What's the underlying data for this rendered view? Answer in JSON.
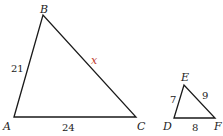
{
  "diagram": {
    "type": "similar-triangles",
    "triangle_abc": {
      "vertices": {
        "A": "A",
        "B": "B",
        "C": "C"
      },
      "sides": {
        "AB": "21",
        "AC": "24",
        "BC": "x"
      }
    },
    "triangle_def": {
      "vertices": {
        "D": "D",
        "E": "E",
        "F": "F"
      },
      "sides": {
        "DE": "7",
        "DF": "8",
        "EF": "9"
      }
    },
    "colors": {
      "stroke": "#1a1a1a",
      "unknown": "#c0392b"
    }
  }
}
